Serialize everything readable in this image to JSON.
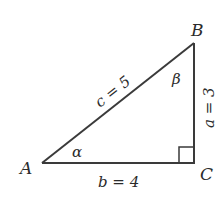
{
  "diagram": {
    "type": "right-triangle",
    "colors": {
      "stroke": "#3a3a3a",
      "text": "#2b2b2b",
      "background": "#ffffff"
    },
    "vertices": {
      "A": {
        "label": "A"
      },
      "B": {
        "label": "B"
      },
      "C": {
        "label": "C"
      }
    },
    "angles": {
      "alpha": {
        "label": "α",
        "at": "A"
      },
      "beta": {
        "label": "β",
        "at": "B"
      },
      "right": {
        "at": "C",
        "marker": "square"
      }
    },
    "sides": {
      "c": {
        "label": "c = 5",
        "between": "A-B"
      },
      "b": {
        "label": "b = 4",
        "between": "A-C"
      },
      "a": {
        "label": "a = 3",
        "between": "B-C"
      }
    }
  }
}
